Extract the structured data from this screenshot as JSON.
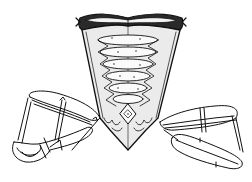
{
  "image": {
    "subject": "18th-century stays bodice with side panniers (line engraving)",
    "background_color": "#ffffff",
    "ink_color": "#111111",
    "width": 252,
    "height": 182
  }
}
